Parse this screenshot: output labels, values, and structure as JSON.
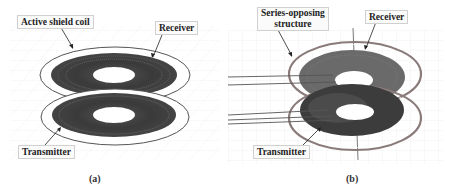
{
  "figure": {
    "panels": [
      {
        "id": "a",
        "caption": "(a)",
        "labels": {
          "shield": "Active shield coil",
          "receiver": "Receiver",
          "transmitter": "Transmitter"
        }
      },
      {
        "id": "b",
        "caption": "(b)",
        "labels": {
          "structure_line1": "Series-opposing",
          "structure_line2": "structure",
          "receiver": "Receiver",
          "transmitter": "Transmitter"
        }
      }
    ],
    "colors": {
      "coil_dark": "#3c3c3c",
      "coil_mid": "#6a6a6a",
      "shield_ring": "#555555",
      "shield_ring_b": "#8a7a7a",
      "grid": "#e6e6e6"
    }
  }
}
